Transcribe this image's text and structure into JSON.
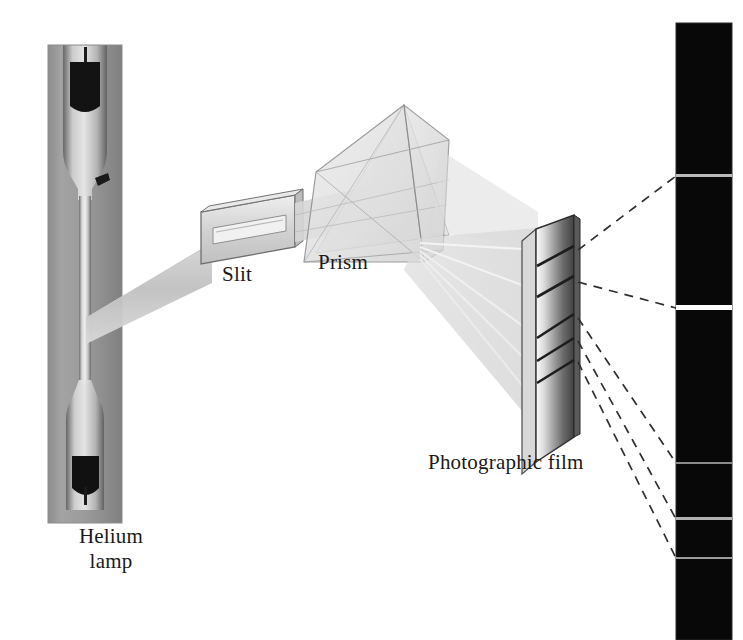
{
  "figure": {
    "type": "optical-spectroscopy-diagram",
    "background_color": "#ffffff",
    "width": 743,
    "height": 640
  },
  "labels": {
    "lamp_line1": "Helium",
    "lamp_line2": "lamp",
    "slit": "Slit",
    "prism": "Prism",
    "film": "Photographic film"
  },
  "components": {
    "lamp": {
      "name": "Helium lamp",
      "photo_tint": "#9a9a9a",
      "glass_tint": "#c9c9c9",
      "electrode_color": "#141414",
      "x": 48,
      "y": 45,
      "w": 74,
      "h": 478
    },
    "light_beam": {
      "name": "collimated-light-beam",
      "color": "#c4c4c4",
      "from": "lamp",
      "to": "slit"
    },
    "slit": {
      "name": "Slit",
      "glass_color": "#d7d7d7",
      "edge_color": "#6e6e6e",
      "aperture_color": "#ededed"
    },
    "prism": {
      "name": "Prism",
      "face_color": "#e3e3e3",
      "edge_color": "#7a7a7a",
      "shape": "triangular-prism"
    },
    "dispersed_rays": {
      "name": "dispersed-light-rays",
      "count": 5,
      "color": "#d0d0d0",
      "highlight_color": "#f2f2f2"
    },
    "film": {
      "name": "Photographic film",
      "front_gradient": [
        "#f4f4f4",
        "#8f8f8f",
        "#3a3a3a"
      ],
      "edge_color": "#2b2b2b",
      "line_color": "#1f1f1f",
      "exposed_line_count": 5
    },
    "spectrum_strip": {
      "name": "developed-spectrum-strip",
      "background": "#080808",
      "x": 676,
      "y": 23,
      "w": 56,
      "h": 617,
      "lines": [
        {
          "id": "line-1",
          "y": 176,
          "thickness": 3,
          "brightness": "medium",
          "color": "#b9b9b9"
        },
        {
          "id": "line-2",
          "y": 308,
          "thickness": 5,
          "brightness": "high",
          "color": "#ffffff"
        },
        {
          "id": "line-3",
          "y": 463,
          "thickness": 2,
          "brightness": "low",
          "color": "#8a8a8a"
        },
        {
          "id": "line-4",
          "y": 519,
          "thickness": 3,
          "brightness": "medium",
          "color": "#b0b0b0"
        },
        {
          "id": "line-5",
          "y": 558,
          "thickness": 2,
          "brightness": "low",
          "color": "#9a9a9a"
        }
      ]
    },
    "callout_lines": {
      "name": "dashed-callout-lines",
      "style": "dashed",
      "color": "#333333",
      "count": 5
    }
  }
}
